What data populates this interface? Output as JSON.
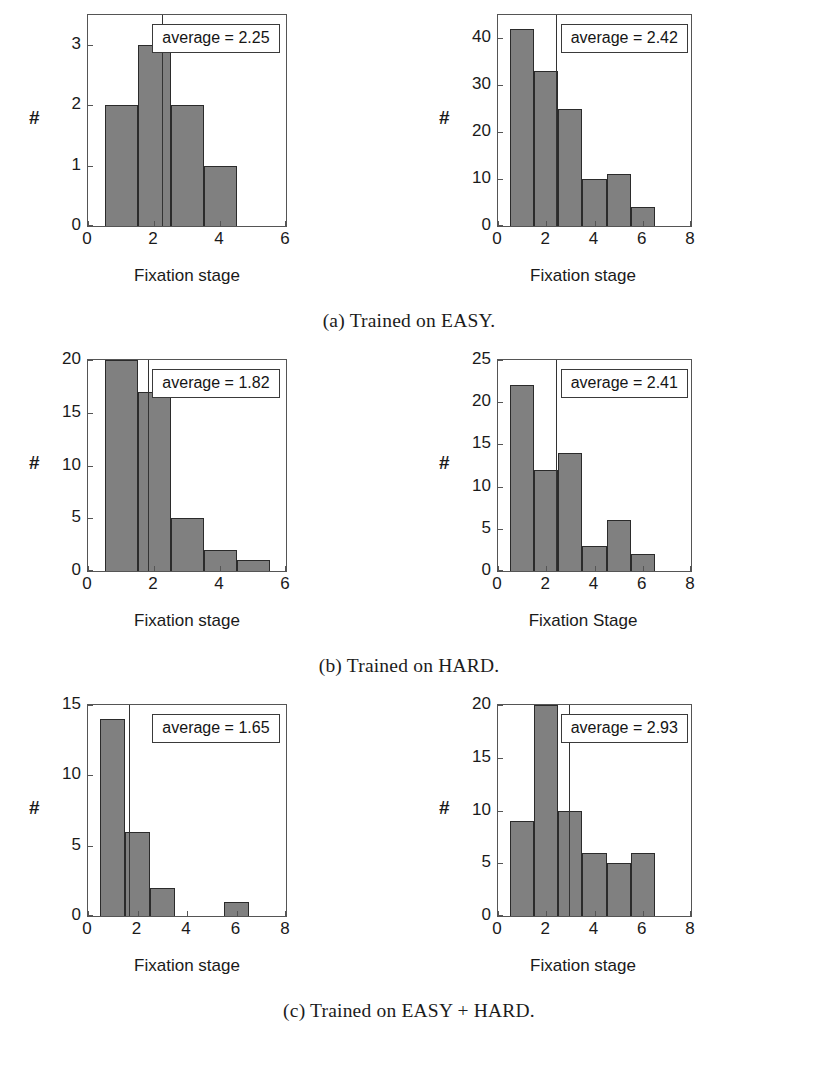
{
  "figure": {
    "panel_rows": [
      {
        "caption": "(a) Trained on EASY."
      },
      {
        "caption": "(b) Trained on HARD."
      },
      {
        "caption": "(c) Trained on EASY + HARD."
      }
    ]
  },
  "colors": {
    "bar_fill": "#808080",
    "bar_edge": "#2b2b2b",
    "axis": "#555555",
    "mean_line": "#333333",
    "text": "#1a1a1a",
    "background": "#ffffff"
  },
  "chart_data": [
    {
      "id": "panel-a-left",
      "type": "bar",
      "title": "",
      "xlabel": "Fixation stage",
      "ylabel": "#",
      "xlim": [
        0,
        6
      ],
      "ylim": [
        0,
        3.5
      ],
      "xticks": [
        0,
        2,
        4,
        6
      ],
      "xtick_labels": [
        "0",
        "2",
        "4",
        "6"
      ],
      "yticks": [
        0,
        1,
        2,
        3
      ],
      "ytick_labels": [
        "0",
        "1",
        "2",
        "3"
      ],
      "grid": false,
      "bin_edges": [
        0.5,
        1.5,
        2.5,
        3.5,
        4.5
      ],
      "bin_centers": [
        1,
        2,
        3,
        4
      ],
      "values": [
        2,
        3,
        2,
        1
      ],
      "annotation": "average = 2.25",
      "mean": 2.25
    },
    {
      "id": "panel-a-right",
      "type": "bar",
      "title": "",
      "xlabel": "Fixation stage",
      "ylabel": "#",
      "xlim": [
        0,
        8
      ],
      "ylim": [
        0,
        45
      ],
      "xticks": [
        0,
        2,
        4,
        6,
        8
      ],
      "xtick_labels": [
        "0",
        "2",
        "4",
        "6",
        "8"
      ],
      "yticks": [
        0,
        10,
        20,
        30,
        40
      ],
      "ytick_labels": [
        "0",
        "10",
        "20",
        "30",
        "40"
      ],
      "grid": false,
      "bin_edges": [
        0.5,
        1.5,
        2.5,
        3.5,
        4.5,
        5.5,
        6.5
      ],
      "bin_centers": [
        1,
        2,
        3,
        4,
        5,
        6
      ],
      "values": [
        42,
        33,
        25,
        10,
        11,
        4
      ],
      "annotation": "average = 2.42",
      "mean": 2.42
    },
    {
      "id": "panel-b-left",
      "type": "bar",
      "title": "",
      "xlabel": "Fixation stage",
      "ylabel": "#",
      "xlim": [
        0,
        6
      ],
      "ylim": [
        0,
        20
      ],
      "xticks": [
        0,
        2,
        4,
        6
      ],
      "xtick_labels": [
        "0",
        "2",
        "4",
        "6"
      ],
      "yticks": [
        0,
        5,
        10,
        15,
        20
      ],
      "ytick_labels": [
        "0",
        "5",
        "10",
        "15",
        "20"
      ],
      "grid": false,
      "bin_edges": [
        0.5,
        1.5,
        2.5,
        3.5,
        4.5,
        5.5
      ],
      "bin_centers": [
        1,
        2,
        3,
        4,
        5
      ],
      "values": [
        20,
        17,
        5,
        2,
        1
      ],
      "annotation": "average = 1.82",
      "mean": 1.82
    },
    {
      "id": "panel-b-right",
      "type": "bar",
      "title": "",
      "xlabel": "Fixation Stage",
      "ylabel": "#",
      "xlim": [
        0,
        8
      ],
      "ylim": [
        0,
        25
      ],
      "xticks": [
        0,
        2,
        4,
        6,
        8
      ],
      "xtick_labels": [
        "0",
        "2",
        "4",
        "6",
        "8"
      ],
      "yticks": [
        0,
        5,
        10,
        15,
        20,
        25
      ],
      "ytick_labels": [
        "0",
        "5",
        "10",
        "15",
        "20",
        "25"
      ],
      "grid": false,
      "bin_edges": [
        0.5,
        1.5,
        2.5,
        3.5,
        4.5,
        5.5,
        6.5
      ],
      "bin_centers": [
        1,
        2,
        3,
        4,
        5,
        6
      ],
      "values": [
        22,
        12,
        14,
        3,
        6,
        2
      ],
      "annotation": "average = 2.41",
      "mean": 2.41
    },
    {
      "id": "panel-c-left",
      "type": "bar",
      "title": "",
      "xlabel": "Fixation stage",
      "ylabel": "#",
      "xlim": [
        0,
        8
      ],
      "ylim": [
        0,
        15
      ],
      "xticks": [
        0,
        2,
        4,
        6,
        8
      ],
      "xtick_labels": [
        "0",
        "2",
        "4",
        "6",
        "8"
      ],
      "yticks": [
        0,
        5,
        10,
        15
      ],
      "ytick_labels": [
        "0",
        "5",
        "10",
        "15"
      ],
      "grid": false,
      "bin_edges": [
        0.5,
        1.5,
        2.5,
        3.5,
        4.5,
        5.5,
        6.5
      ],
      "bin_centers": [
        1,
        2,
        3,
        4,
        5,
        6
      ],
      "values": [
        14,
        6,
        2,
        0,
        0,
        1
      ],
      "annotation": "average = 1.65",
      "mean": 1.65
    },
    {
      "id": "panel-c-right",
      "type": "bar",
      "title": "",
      "xlabel": "Fixation stage",
      "ylabel": "#",
      "xlim": [
        0,
        8
      ],
      "ylim": [
        0,
        20
      ],
      "xticks": [
        0,
        2,
        4,
        6,
        8
      ],
      "xtick_labels": [
        "0",
        "2",
        "4",
        "6",
        "8"
      ],
      "yticks": [
        0,
        5,
        10,
        15,
        20
      ],
      "ytick_labels": [
        "0",
        "5",
        "10",
        "15",
        "20"
      ],
      "grid": false,
      "bin_edges": [
        0.5,
        1.5,
        2.5,
        3.5,
        4.5,
        5.5,
        6.5
      ],
      "bin_centers": [
        1,
        2,
        3,
        4,
        5,
        6
      ],
      "values": [
        9,
        20,
        10,
        6,
        5,
        6
      ],
      "annotation": "average = 2.93",
      "mean": 2.93
    }
  ]
}
